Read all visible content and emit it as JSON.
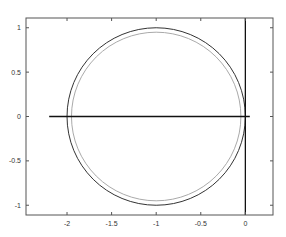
{
  "chart_data": {
    "type": "line",
    "title": "",
    "xlabel": "",
    "ylabel": "",
    "xlim": [
      -2.46,
      0.31
    ],
    "ylim": [
      -1.11,
      1.11
    ],
    "grid": false,
    "legend": null,
    "x_ticks": [
      -2,
      -1.5,
      -1,
      -0.5,
      0
    ],
    "x_tick_labels": [
      "-2",
      "-1.5",
      "-1",
      "-0.5",
      "0"
    ],
    "y_ticks": [
      -1,
      -0.5,
      0,
      0.5,
      1
    ],
    "y_tick_labels": [
      "-1",
      "-0.5",
      "0",
      "0.5",
      "1"
    ],
    "series": [
      {
        "name": "outer-circle",
        "kind": "circle",
        "center": [
          -1,
          0
        ],
        "radius": 1.0,
        "color": "#333333"
      },
      {
        "name": "inner-circle",
        "kind": "circle",
        "center": [
          -1,
          0
        ],
        "radius": 0.95,
        "color": "#aaaaaa"
      },
      {
        "name": "real-axis-line",
        "kind": "segment",
        "x": [
          -2.2,
          0.05
        ],
        "y": [
          0,
          0
        ],
        "color": "#111111"
      },
      {
        "name": "imag-axis-line",
        "kind": "segment",
        "x": [
          0,
          0
        ],
        "y": [
          -1.11,
          1.11
        ],
        "color": "#111111"
      }
    ]
  }
}
